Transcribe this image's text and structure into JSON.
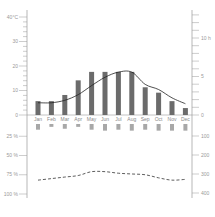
{
  "chart_data": {
    "type": "bar",
    "title": "",
    "categories": [
      "Jan",
      "Feb",
      "Mar",
      "Apr",
      "May",
      "Jun",
      "Jul",
      "Aug",
      "Sep",
      "Oct",
      "Nov",
      "Dec"
    ],
    "series": [
      {
        "name": "Sunshine hours",
        "kind": "bar",
        "axis": "right-upper",
        "unit": "h",
        "values": [
          1.8,
          1.8,
          2.6,
          4.5,
          5.6,
          5.6,
          5.6,
          5.6,
          3.6,
          2.9,
          1.8,
          0.9
        ]
      },
      {
        "name": "Temperature",
        "kind": "line",
        "axis": "left-upper",
        "unit": "°C",
        "values": [
          5,
          5,
          6,
          8.3,
          12,
          15.4,
          17.5,
          17.5,
          12.5,
          10.4,
          7,
          4.6
        ]
      },
      {
        "name": "Precipitation",
        "kind": "bar",
        "axis": "right-lower",
        "unit": "mm",
        "values": [
          30,
          15,
          25,
          15,
          30,
          35,
          30,
          35,
          30,
          35,
          35,
          35
        ]
      },
      {
        "name": "Humidity",
        "kind": "dashed-line",
        "axis": "left-lower",
        "unit": "%",
        "values": [
          82,
          80,
          78,
          76,
          71,
          71,
          73,
          74,
          75,
          79,
          82,
          81
        ]
      }
    ],
    "axes": {
      "left_upper": {
        "label": "°C",
        "ticks": [
          "40°C",
          "30",
          "20",
          "10",
          "0"
        ],
        "range": [
          0,
          40
        ]
      },
      "right_upper": {
        "label": "h",
        "ticks": [
          "10 h",
          "5",
          "0"
        ],
        "range": [
          0,
          13
        ]
      },
      "left_lower": {
        "label": "%",
        "ticks": [
          "25 %",
          "50 %",
          "75 %",
          "100 %"
        ],
        "range": [
          0,
          100
        ],
        "inverted": true
      },
      "right_lower": {
        "label": "mm",
        "ticks": [
          "100",
          "200",
          "300",
          "400"
        ],
        "range": [
          0,
          400
        ],
        "inverted": true
      }
    },
    "grid": false,
    "legend": "none"
  },
  "colors": {
    "bar": "#6b6b6b",
    "precip_bar": "#a8a8a8",
    "line": "#222222",
    "axis": "#9a9a9a"
  }
}
